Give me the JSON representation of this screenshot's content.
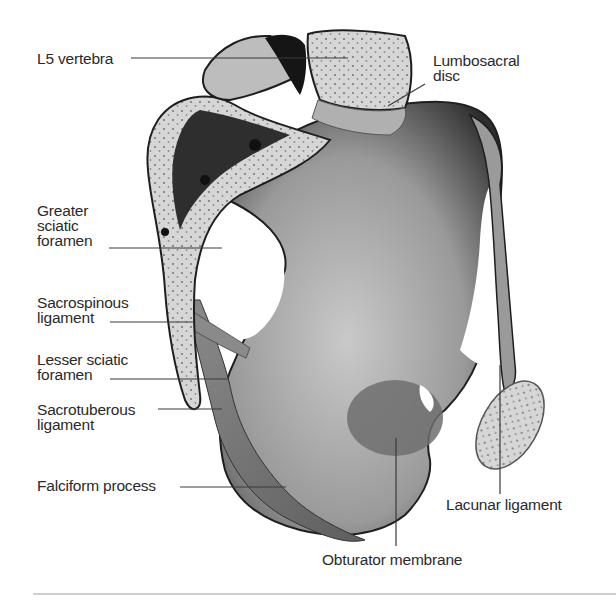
{
  "figure": {
    "colors": {
      "background": "#ffffff",
      "bone_light": "#d9d9d9",
      "bone_mid": "#a8a8a8",
      "bone_dark": "#2b2b2b",
      "ligament": "#8c8c8c",
      "label_text": "#2a2a2a",
      "leader_line": "#3a3a3a",
      "divider": "#cfcfcf"
    }
  },
  "labels": {
    "l5_vertebra": {
      "lines": [
        "L5 vertebra"
      ]
    },
    "lumbosacral_disc": {
      "lines": [
        "Lumbosacral",
        "disc"
      ]
    },
    "greater_sciatic_foramen": {
      "lines": [
        "Greater",
        "sciatic",
        "foramen"
      ]
    },
    "sacrospinous_ligament": {
      "lines": [
        "Sacrospinous",
        "ligament"
      ]
    },
    "lesser_sciatic_foramen": {
      "lines": [
        "Lesser sciatic",
        "foramen"
      ]
    },
    "sacrotuberous_ligament": {
      "lines": [
        "Sacrotuberous",
        "ligament"
      ]
    },
    "falciform_process": {
      "lines": [
        "Falciform process"
      ]
    },
    "lacunar_ligament": {
      "lines": [
        "Lacunar ligament"
      ]
    },
    "obturator_membrane": {
      "lines": [
        "Obturator membrane"
      ]
    }
  }
}
